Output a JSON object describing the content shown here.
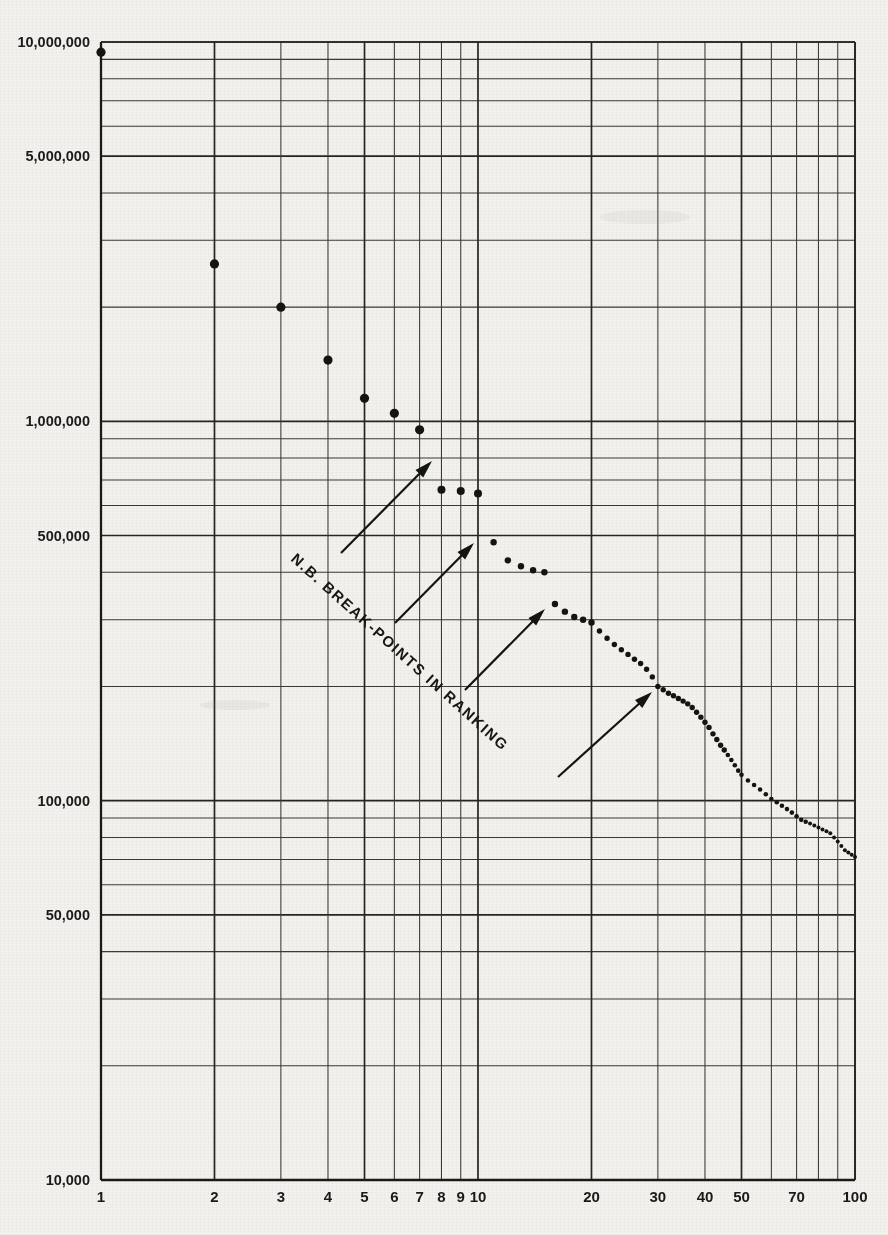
{
  "chart_data": {
    "type": "scatter",
    "title": "",
    "subtitle": "",
    "xlabel": "",
    "ylabel": "",
    "xscale": "log",
    "yscale": "log",
    "xlim": [
      1,
      100
    ],
    "ylim": [
      10000,
      10000000
    ],
    "grid": true,
    "legend": null,
    "x_tick_labels": [
      "1",
      "2",
      "3",
      "4",
      "5",
      "6",
      "7",
      "8",
      "9",
      "10",
      "20",
      "30",
      "40",
      "50",
      "70",
      "100"
    ],
    "x_tick_values": [
      1,
      2,
      3,
      4,
      5,
      6,
      7,
      8,
      9,
      10,
      20,
      30,
      40,
      50,
      70,
      100
    ],
    "y_tick_labels": [
      "10,000,000",
      "5,000,000",
      "1,000,000",
      "500,000",
      "100,000",
      "50,000",
      "10,000"
    ],
    "y_tick_values": [
      10000000,
      5000000,
      1000000,
      500000,
      100000,
      50000,
      10000
    ],
    "annotations": [
      {
        "text": "N.B.  BREAK-POINTS  IN  RANKING",
        "rotation_deg": 42,
        "x": 6,
        "y": 330000
      }
    ],
    "break_point_markers": [
      {
        "label": "break-point-arrow-1",
        "points_to_rank": 8,
        "points_to_value": 650000
      },
      {
        "label": "break-point-arrow-2",
        "points_to_rank": 11,
        "points_to_value": 460000
      },
      {
        "label": "break-point-arrow-3",
        "points_to_rank": 17,
        "points_to_value": 310000
      },
      {
        "label": "break-point-arrow-4",
        "points_to_rank": 30,
        "points_to_value": 200000
      }
    ],
    "series": [
      {
        "name": "city size by rank",
        "x": [
          1,
          2,
          3,
          4,
          5,
          6,
          7,
          8,
          9,
          10,
          11,
          12,
          13,
          14,
          15,
          16,
          17,
          18,
          19,
          20,
          21,
          22,
          23,
          24,
          25,
          26,
          27,
          28,
          29,
          30,
          31,
          32,
          33,
          34,
          35,
          36,
          37,
          38,
          39,
          40,
          41,
          42,
          43,
          44,
          45,
          46,
          47,
          48,
          49,
          50,
          52,
          54,
          56,
          58,
          60,
          62,
          64,
          66,
          68,
          70,
          72,
          74,
          76,
          78,
          80,
          82,
          84,
          86,
          88,
          90,
          92,
          94,
          96,
          98,
          100
        ],
        "values": [
          9400000,
          2600000,
          2000000,
          1450000,
          1150000,
          1050000,
          950000,
          660000,
          655000,
          645000,
          480000,
          430000,
          415000,
          405000,
          400000,
          330000,
          315000,
          305000,
          300000,
          295000,
          280000,
          268000,
          258000,
          250000,
          243000,
          236000,
          230000,
          222000,
          212000,
          200000,
          196000,
          192000,
          189000,
          186000,
          183000,
          180000,
          176000,
          171000,
          166000,
          161000,
          156000,
          150000,
          145000,
          140000,
          136000,
          132000,
          128000,
          124000,
          120000,
          117000,
          113000,
          110000,
          107000,
          104000,
          101000,
          99000,
          97000,
          95000,
          93000,
          91000,
          89000,
          88000,
          87000,
          86000,
          85000,
          84000,
          83000,
          82000,
          80000,
          78000,
          76000,
          74000,
          73000,
          72000,
          71000
        ]
      }
    ]
  }
}
